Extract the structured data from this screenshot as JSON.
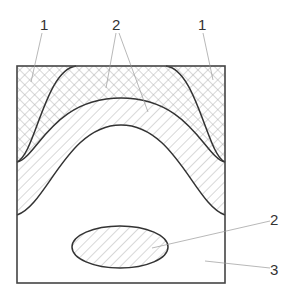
{
  "diagram": {
    "type": "cross-section schematic",
    "colors": {
      "outline": "#333333",
      "hatch": "#a8a8a8",
      "leader": "#9a9a9a",
      "background": "#ffffff"
    },
    "regions": [
      {
        "id": "1",
        "fill": "crosshatch",
        "description": "corner zones and arched band between outer and middle curves"
      },
      {
        "id": "2",
        "fill": "single diagonal hatch",
        "description": "arched band between middle and inner curves, and elliptical inclusion"
      },
      {
        "id": "3",
        "fill": "none",
        "description": "remaining matrix region"
      }
    ],
    "labels": {
      "top_left": "1",
      "top_center": "2",
      "top_right": "1",
      "right_ellipse": "2",
      "right_bottom": "3"
    }
  }
}
